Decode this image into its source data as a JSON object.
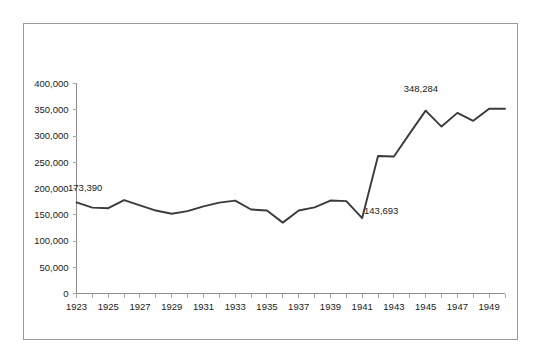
{
  "chart_data": {
    "type": "line",
    "title": "",
    "subtitle": "",
    "xlabel": "",
    "ylabel": "",
    "grid": false,
    "legend": "none",
    "xlim": [
      1923,
      1950
    ],
    "ylim": [
      0,
      400000
    ],
    "ytick_labels": [
      "400,000",
      "350,000",
      "300,000",
      "250,000",
      "200,000",
      "150,000",
      "100,000",
      "50,000",
      "0"
    ],
    "ytick_values": [
      400000,
      350000,
      300000,
      250000,
      200000,
      150000,
      100000,
      50000,
      0
    ],
    "xtick_labels": [
      "1923",
      "1925",
      "1927",
      "1929",
      "1931",
      "1933",
      "1935",
      "1937",
      "1939",
      "1941",
      "1943",
      "1945",
      "1947",
      "1949"
    ],
    "xtick_values": [
      1923,
      1925,
      1927,
      1929,
      1931,
      1933,
      1935,
      1937,
      1939,
      1941,
      1943,
      1945,
      1947,
      1949
    ],
    "x": [
      1923,
      1924,
      1925,
      1926,
      1927,
      1928,
      1929,
      1930,
      1931,
      1932,
      1933,
      1934,
      1935,
      1936,
      1937,
      1938,
      1939,
      1940,
      1941,
      1942,
      1943,
      1944,
      1945,
      1946,
      1947,
      1948,
      1949,
      1950
    ],
    "values": [
      173390,
      163500,
      162500,
      178000,
      168000,
      158000,
      152000,
      157000,
      166000,
      173000,
      177000,
      160000,
      158000,
      135000,
      158000,
      164000,
      177000,
      176000,
      143693,
      262000,
      261000,
      305000,
      348284,
      318000,
      344000,
      329000,
      352000,
      352000
    ],
    "series": [
      {
        "name": "series-1",
        "color": "#3b3b3b",
        "values": [
          173390,
          163500,
          162500,
          178000,
          168000,
          158000,
          152000,
          157000,
          166000,
          173000,
          177000,
          160000,
          158000,
          135000,
          158000,
          164000,
          177000,
          176000,
          143693,
          262000,
          261000,
          305000,
          348284,
          318000,
          344000,
          329000,
          352000,
          352000
        ]
      }
    ],
    "annotations": [
      {
        "text": "173,390",
        "x": 1923.55,
        "y": 195000,
        "anchor": "start"
      },
      {
        "text": "143,693",
        "x": 1942.2,
        "y": 152000,
        "anchor": "start"
      },
      {
        "text": "348,284",
        "x": 1944.7,
        "y": 383000,
        "anchor": "middle"
      }
    ]
  },
  "frame": {
    "border_color": "#9a9a9a",
    "background": "#ffffff"
  }
}
